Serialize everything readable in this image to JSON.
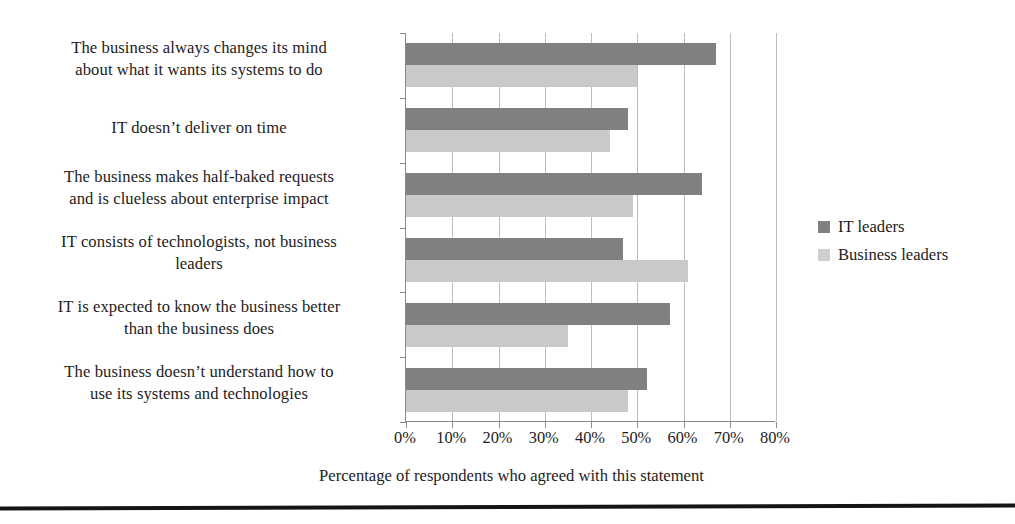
{
  "chart_data": {
    "type": "bar",
    "orientation": "horizontal",
    "title": "",
    "subtitle": "",
    "xlabel": "Percentage of respondents who agreed with this statement",
    "ylabel": "",
    "xlim": [
      0,
      80
    ],
    "xtick_values": [
      0,
      10,
      20,
      30,
      40,
      50,
      60,
      70,
      80
    ],
    "xtick_labels": [
      "0%",
      "10%",
      "20%",
      "30%",
      "40%",
      "50%",
      "60%",
      "70%",
      "80%"
    ],
    "grid": "vertical",
    "legend_position": "right",
    "categories": [
      "The business always changes its mind about what it wants its systems to do",
      "IT doesn’t deliver on time",
      "The business makes half-baked requests and is clueless about enterprise impact",
      "IT consists of technologists, not business leaders",
      "IT is expected to know the business better than the business does",
      "The business doesn’t understand how to use its systems and technologies"
    ],
    "category_lines": [
      [
        "The business always changes its mind",
        "about what it wants its systems to do"
      ],
      [
        "IT doesn’t deliver on time"
      ],
      [
        "The business makes half-baked requests",
        "and is clueless about enterprise impact"
      ],
      [
        "IT consists of technologists, not business",
        "leaders"
      ],
      [
        "IT is expected to know the business better",
        "than the business does"
      ],
      [
        "The business doesn’t understand how to",
        "use its systems and technologies"
      ]
    ],
    "series": [
      {
        "name": "IT leaders",
        "color": "#808080",
        "values": [
          67,
          48,
          64,
          47,
          57,
          52
        ]
      },
      {
        "name": "Business leaders",
        "color": "#c9c9c9",
        "values": [
          50,
          44,
          49,
          61,
          35,
          48
        ]
      }
    ],
    "annotations": []
  },
  "legend": {
    "items": [
      {
        "label": "IT leaders",
        "swatch": "#808080"
      },
      {
        "label": "Business leaders",
        "swatch": "#cfcfcf"
      }
    ]
  },
  "axis": {
    "x_title": "Percentage of respondents who agreed with this statement"
  }
}
